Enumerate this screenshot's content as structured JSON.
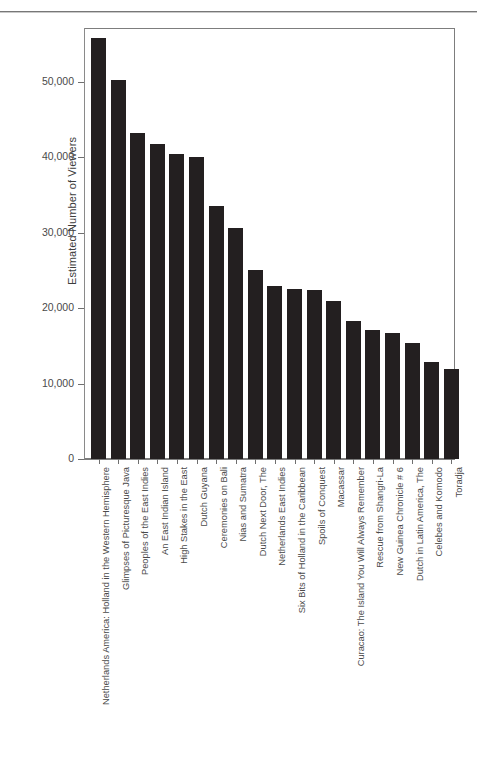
{
  "figure": {
    "top_rule": "horizontal-rule",
    "axis_color": "#7d7d7d",
    "bar_color": "#231f20",
    "text_color": "#4a4a4a"
  },
  "chart_data": {
    "type": "bar",
    "title": "",
    "xlabel": "",
    "ylabel": "Estimated Number of Viewers",
    "ylim": [
      0,
      57000
    ],
    "grid": false,
    "legend": false,
    "ytick_labels": [
      "0",
      "10,000",
      "20,000",
      "30,000",
      "40,000",
      "50,000"
    ],
    "ytick_values": [
      0,
      10000,
      20000,
      30000,
      40000,
      50000
    ],
    "categories": [
      "Netherlands America: Holland in the Western Hemisphere",
      "Glimpses of Picturesque Java",
      "Peoples of the East Indies",
      "An East Indian Island",
      "High Stakes in the East",
      "Dutch Guyana",
      "Ceremonies on Bali",
      "Nias and Sumatra",
      "Dutch Next Door, The",
      "Netherlands East Indies",
      "Six Bits of Holland in the Caribbean",
      "Spoils of Conquest",
      "Macassar",
      "Curacao: The Island You Will Always Remember",
      "Rescue from Shangri-La",
      "New Guinea Chronicle # 6",
      "Dutch in Latin America, The",
      "Celebes and Komodo",
      "Toradja"
    ],
    "values": [
      55800,
      50300,
      43200,
      41800,
      40400,
      40100,
      33500,
      30600,
      25100,
      22900,
      22600,
      22400,
      21000,
      18300,
      17100,
      16700,
      15400,
      12800,
      11900
    ]
  }
}
